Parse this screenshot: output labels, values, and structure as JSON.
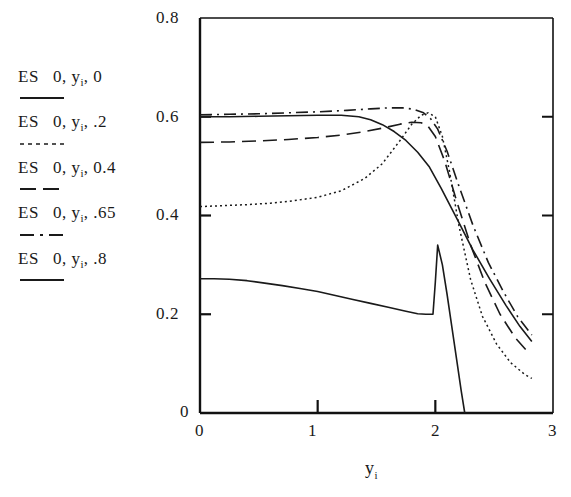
{
  "chart_data": {
    "type": "line",
    "title": "",
    "xlabel": "y_i",
    "ylabel": "",
    "xlim": [
      0,
      3
    ],
    "ylim": [
      0,
      0.8
    ],
    "grid": false,
    "legend_position": "left-outside",
    "xticks": [
      "0",
      "1",
      "2",
      "3"
    ],
    "xtick_values": [
      0,
      1,
      2,
      3
    ],
    "yticks": [
      "0",
      "0.2",
      "0.4",
      "0.6",
      "0.8"
    ],
    "ytick_values": [
      0,
      0.2,
      0.4,
      0.6,
      0.8
    ],
    "series": [
      {
        "name": "ES 0,y_i,0",
        "label_prefix": "ES",
        "label_args": "0,",
        "label_var": "y",
        "label_sub": "i",
        "label_suffix": ", 0",
        "style": "solid",
        "dasharray": "",
        "x": [
          0.0,
          0.12,
          0.25,
          0.4,
          0.55,
          0.7,
          0.85,
          1.0,
          1.15,
          1.3,
          1.45,
          1.6,
          1.75,
          1.85,
          1.92,
          1.98,
          2.0,
          2.02,
          2.06,
          2.1,
          2.14,
          2.18,
          2.22,
          2.25
        ],
        "y": [
          0.272,
          0.272,
          0.271,
          0.268,
          0.263,
          0.258,
          0.252,
          0.246,
          0.238,
          0.23,
          0.222,
          0.214,
          0.206,
          0.201,
          0.2,
          0.2,
          0.265,
          0.34,
          0.3,
          0.24,
          0.175,
          0.11,
          0.045,
          0.0
        ]
      },
      {
        "name": "ES 0,y_i,.2",
        "label_prefix": "ES",
        "label_args": "0,",
        "label_var": "y",
        "label_sub": "i",
        "label_suffix": ", .2",
        "style": "dotted",
        "dasharray": "2,3",
        "x": [
          0.0,
          0.2,
          0.4,
          0.6,
          0.8,
          1.0,
          1.2,
          1.4,
          1.55,
          1.7,
          1.8,
          1.88,
          1.94,
          2.0,
          2.06,
          2.12,
          2.2,
          2.3,
          2.4,
          2.52,
          2.64,
          2.76,
          2.82
        ],
        "y": [
          0.418,
          0.42,
          0.422,
          0.425,
          0.43,
          0.437,
          0.45,
          0.475,
          0.505,
          0.552,
          0.585,
          0.603,
          0.608,
          0.6,
          0.56,
          0.49,
          0.38,
          0.27,
          0.196,
          0.14,
          0.102,
          0.078,
          0.07
        ]
      },
      {
        "name": "ES 0,y_i,0.4",
        "label_prefix": "ES",
        "label_args": "0,",
        "label_var": "y",
        "label_sub": "i",
        "label_suffix": ", 0.4",
        "style": "long-dash",
        "dasharray": "14,7",
        "x": [
          0.0,
          0.25,
          0.5,
          0.75,
          1.0,
          1.2,
          1.4,
          1.55,
          1.7,
          1.8,
          1.88,
          1.94,
          2.0,
          2.08,
          2.18,
          2.3,
          2.42,
          2.55,
          2.68,
          2.8
        ],
        "y": [
          0.548,
          0.549,
          0.551,
          0.554,
          0.558,
          0.563,
          0.57,
          0.577,
          0.585,
          0.589,
          0.588,
          0.58,
          0.56,
          0.51,
          0.43,
          0.34,
          0.265,
          0.2,
          0.152,
          0.12
        ]
      },
      {
        "name": "ES 0,y_i,.65",
        "label_prefix": "ES",
        "label_args": "0,",
        "label_var": "y",
        "label_sub": "i",
        "label_suffix": ", .65",
        "style": "dash-dot",
        "dasharray": "12,5,2,5",
        "x": [
          0.0,
          0.25,
          0.5,
          0.75,
          1.0,
          1.25,
          1.45,
          1.6,
          1.72,
          1.82,
          1.9,
          1.96,
          2.02,
          2.1,
          2.2,
          2.32,
          2.45,
          2.58,
          2.7,
          2.82
        ],
        "y": [
          0.604,
          0.605,
          0.606,
          0.608,
          0.61,
          0.613,
          0.616,
          0.618,
          0.618,
          0.615,
          0.608,
          0.596,
          0.575,
          0.53,
          0.46,
          0.38,
          0.305,
          0.245,
          0.195,
          0.158
        ]
      },
      {
        "name": "ES 0,y_i,.8",
        "label_prefix": "ES",
        "label_args": "0,",
        "label_var": "y",
        "label_sub": "i",
        "label_suffix": ", .8",
        "style": "solid",
        "dasharray": "",
        "x": [
          0.0,
          0.25,
          0.5,
          0.75,
          1.0,
          1.2,
          1.35,
          1.45,
          1.55,
          1.65,
          1.75,
          1.85,
          1.95,
          2.05,
          2.18,
          2.32,
          2.46,
          2.6,
          2.72,
          2.82
        ],
        "y": [
          0.6,
          0.6,
          0.601,
          0.602,
          0.603,
          0.603,
          0.6,
          0.594,
          0.584,
          0.57,
          0.552,
          0.528,
          0.498,
          0.455,
          0.395,
          0.33,
          0.272,
          0.218,
          0.175,
          0.145
        ]
      }
    ]
  },
  "axes": {
    "y_labels": [
      "0.8",
      "0.6",
      "0.4",
      "0.2",
      "0"
    ],
    "x_labels": [
      "0",
      "1",
      "2",
      "3"
    ],
    "x_axis_title_var": "y",
    "x_axis_title_sub": "i"
  },
  "colors": {
    "line": "#1a1a1a",
    "axis": "#111111",
    "background": "#ffffff"
  }
}
